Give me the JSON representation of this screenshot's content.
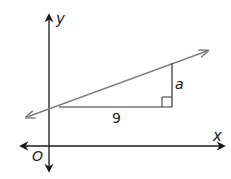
{
  "diagram": {
    "type": "coordinate-plane-slope-triangle",
    "axes": {
      "x_label": "x",
      "y_label": "y",
      "origin_label": "O"
    },
    "line": {
      "color": "#808080",
      "bidirectional": true
    },
    "triangle": {
      "horizontal_leg_label": "9",
      "vertical_leg_label": "a",
      "right_angle_marker": true
    },
    "colors": {
      "axes": "#1a1a1a",
      "line": "#808080",
      "triangle": "#333333"
    }
  }
}
